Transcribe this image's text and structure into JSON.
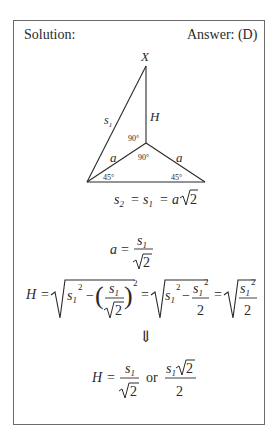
{
  "header": {
    "solution_label": "Solution:",
    "answer_label": "Answer: (D)"
  },
  "diagram": {
    "vertex_label": "X",
    "slant_edge_label": "s",
    "slant_edge_sub": "1",
    "height_label": "H",
    "base_leg_left": "a",
    "base_leg_right": "a",
    "angle_top": "90°",
    "angle_center": "90°",
    "angle_left": "45°",
    "angle_right": "45°"
  },
  "equations": {
    "eq1": "s₂ = s₁ = a√2",
    "eq2": "a = s₁ / √2",
    "eq3": "H = √(s₁² − (s₁/√2)²) = √(s₁² − s₁²/2) = √(s₁²/2)",
    "arrow": "⇓",
    "eq4": "H = s₁/√2 or s₁√2/2",
    "or_word": "or"
  },
  "colors": {
    "border": "#6a6a6a",
    "text": "#2a2a2a",
    "background": "#ffffff"
  }
}
